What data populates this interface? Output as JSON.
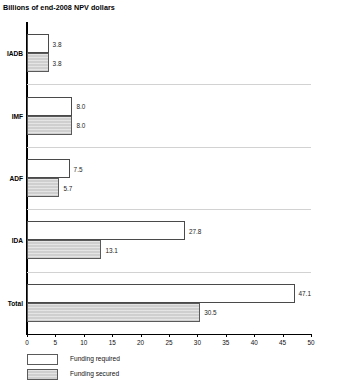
{
  "chart_data": {
    "type": "bar",
    "orientation": "horizontal",
    "title": "Billions of end-2008 NPV dollars",
    "xlabel": "",
    "ylabel": "",
    "xlim": [
      0,
      50
    ],
    "xticks": [
      0,
      5,
      10,
      15,
      20,
      25,
      30,
      35,
      40,
      45,
      50
    ],
    "xtick_labels": [
      "0",
      "5",
      "10",
      "15",
      "20",
      "25",
      "30",
      "35",
      "40",
      "45",
      "50"
    ],
    "grid": false,
    "legend_position": "bottom-left",
    "categories": [
      "IADB",
      "IMF",
      "ADF",
      "IDA",
      "Total"
    ],
    "series": [
      {
        "name": "Funding required",
        "color": "#ffffff",
        "values": [
          3.8,
          8.0,
          7.5,
          27.8,
          47.1
        ],
        "labels": [
          "3.8",
          "8.0",
          "7.5",
          "27.8",
          "47.1"
        ]
      },
      {
        "name": "Funding secured",
        "color": "#cfcfcf",
        "values": [
          3.8,
          8.0,
          5.7,
          13.1,
          30.5
        ],
        "labels": [
          "3.8",
          "8.0",
          "5.7",
          "13.1",
          "30.5"
        ]
      }
    ]
  },
  "legend": {
    "items": [
      {
        "label": "Funding required",
        "swatch": "white"
      },
      {
        "label": "Funding secured",
        "swatch": "gray"
      }
    ]
  }
}
